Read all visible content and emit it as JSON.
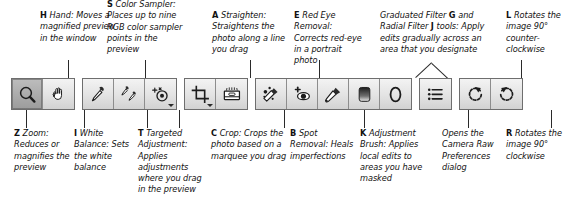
{
  "figure": {
    "accent_color": "#2a2a2a",
    "text_color": "#111111",
    "toolbar_bg": "#e9e9e9",
    "button_border": "#6e6e6e"
  },
  "top_callouts": [
    {
      "key": "H",
      "text": "Hand: Moves a magnified preview in the window",
      "target_icon": "hand-icon"
    },
    {
      "key": "S",
      "text": "Color Sampler: Places up to nine RGB color sampler points in the preview",
      "target_icon": "color-sampler-icon"
    },
    {
      "key": "A",
      "text": "Straighten: Straightens the photo along a line you drag",
      "target_icon": "straighten-icon"
    },
    {
      "key": "E",
      "text": "Red Eye Removal: Corrects red-eye in a portrait photo",
      "target_icon": "red-eye-removal-icon"
    },
    {
      "key_inline_1": "G",
      "key_inline_2": "J",
      "text_part_1": "Graduated Filter ",
      "text_part_2": " and Radial Filter ",
      "text_part_3": " tools: Apply edits gradually across an area that you designate",
      "target_icon": "graduated-filter-icon, radial-filter-icon"
    },
    {
      "key": "L",
      "text": "Rotates the image 90° counter-clockwise",
      "target_icon": "rotate-counter-clockwise-icon"
    }
  ],
  "bottom_callouts": [
    {
      "key": "Z",
      "text": "Zoom: Reduces or magnifies the preview",
      "target_icon": "zoom-icon"
    },
    {
      "key": "I",
      "text": "White Balance: Sets the white balance",
      "target_icon": "white-balance-icon"
    },
    {
      "key": "T",
      "text": "Targeted Adjustment: Applies adjustments where you drag in the preview",
      "target_icon": "targeted-adjustment-icon"
    },
    {
      "key": "C",
      "text": "Crop: Crops the photo based on a marquee you drag",
      "target_icon": "crop-icon"
    },
    {
      "key": "B",
      "text": "Spot Removal: Heals imperfections",
      "target_icon": "spot-removal-icon"
    },
    {
      "key": "K",
      "text": "Adjustment Brush: Applies local edits to areas you have masked",
      "target_icon": "adjustment-brush-icon"
    },
    {
      "key": "",
      "text": "Opens the Camera Raw Preferences dialog",
      "target_icon": "preferences-icon"
    },
    {
      "key": "R",
      "text": "Rotates the image 90° clockwise",
      "target_icon": "rotate-clockwise-icon"
    }
  ],
  "toolbar": {
    "groups": [
      {
        "name": "navigation",
        "buttons": [
          {
            "icon": "zoom-icon",
            "label": "Zoom",
            "selected": true,
            "has_menu": false
          },
          {
            "icon": "hand-icon",
            "label": "Hand",
            "selected": false,
            "has_menu": false
          }
        ]
      },
      {
        "name": "sampling",
        "buttons": [
          {
            "icon": "white-balance-icon",
            "label": "White Balance",
            "selected": false,
            "has_menu": false
          },
          {
            "icon": "color-sampler-icon",
            "label": "Color Sampler",
            "selected": false,
            "has_menu": false
          },
          {
            "icon": "targeted-adjustment-icon",
            "label": "Targeted Adjustment",
            "selected": false,
            "has_menu": true
          }
        ]
      },
      {
        "name": "geometry",
        "buttons": [
          {
            "icon": "crop-icon",
            "label": "Crop",
            "selected": false,
            "has_menu": true
          },
          {
            "icon": "straighten-icon",
            "label": "Straighten",
            "selected": false,
            "has_menu": false
          }
        ]
      },
      {
        "name": "retouch",
        "buttons": [
          {
            "icon": "spot-removal-icon",
            "label": "Spot Removal",
            "selected": false,
            "has_menu": false
          },
          {
            "icon": "red-eye-removal-icon",
            "label": "Red Eye Removal",
            "selected": false,
            "has_menu": false
          },
          {
            "icon": "adjustment-brush-icon",
            "label": "Adjustment Brush",
            "selected": false,
            "has_menu": false
          },
          {
            "icon": "graduated-filter-icon",
            "label": "Graduated Filter",
            "selected": false,
            "has_menu": false
          },
          {
            "icon": "radial-filter-icon",
            "label": "Radial Filter",
            "selected": false,
            "has_menu": false
          }
        ]
      },
      {
        "name": "preferences",
        "buttons": [
          {
            "icon": "preferences-icon",
            "label": "Open Preferences Dialog",
            "selected": false,
            "has_menu": false
          }
        ]
      },
      {
        "name": "rotation",
        "buttons": [
          {
            "icon": "rotate-counter-clockwise-icon",
            "label": "Rotate 90° Counter-clockwise",
            "selected": false,
            "has_menu": false
          },
          {
            "icon": "rotate-clockwise-icon",
            "label": "Rotate 90° Clockwise",
            "selected": false,
            "has_menu": false
          }
        ]
      }
    ]
  }
}
